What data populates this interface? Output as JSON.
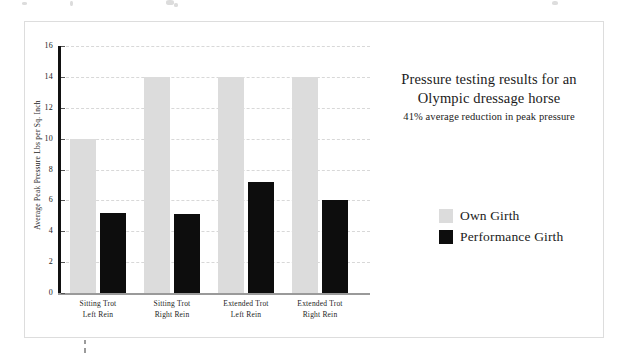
{
  "chart_data": {
    "type": "bar",
    "title": "Pressure testing results for an Olympic dressage horse",
    "title_line1": "Pressure testing results for an",
    "title_line2": "Olympic dressage horse",
    "subtitle": "41% average reduction in peak pressure",
    "xlabel": "",
    "ylabel": "Average Peak Pressure Lbs per Sq. Inch",
    "ylim": [
      0,
      16
    ],
    "ytick_step": 2,
    "yticks": [
      0,
      2,
      4,
      6,
      8,
      10,
      12,
      14,
      16
    ],
    "grid": true,
    "legend_position": "right",
    "categories": [
      "Sitting Trot Left Rein",
      "Sitting Trot Right Rein",
      "Extended Trot Left Rein",
      "Extended Trot Right Rein"
    ],
    "category_lines": [
      [
        "Sitting Trot",
        "Left Rein"
      ],
      [
        "Sitting Trot",
        "Right Rein"
      ],
      [
        "Extended Trot",
        "Left Rein"
      ],
      [
        "Extended Trot",
        "Right Rein"
      ]
    ],
    "series": [
      {
        "name": "Own Girth",
        "color": "#dcdcdc",
        "values": [
          10.0,
          14.0,
          14.0,
          14.0
        ]
      },
      {
        "name": "Performance Girth",
        "color": "#0d0d0d",
        "values": [
          5.2,
          5.1,
          7.2,
          6.0
        ]
      }
    ]
  },
  "colors": {
    "own_girth": "#dcdcdc",
    "performance_girth": "#0d0d0d",
    "axis": "#111111",
    "grid": "#d8d8d8",
    "frame": "#dddddd"
  }
}
